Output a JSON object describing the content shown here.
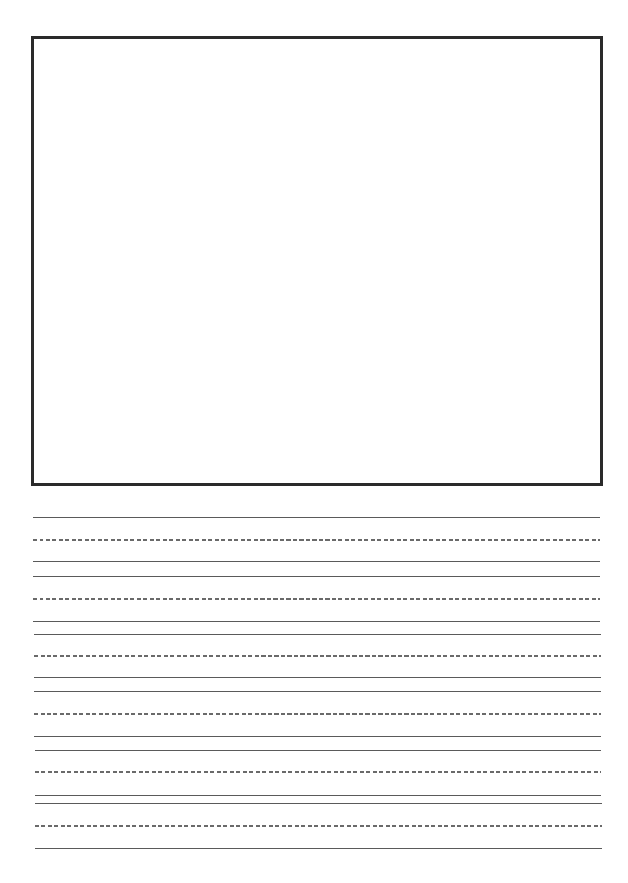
{
  "page": {
    "type": "handwriting-practice-sheet",
    "drawing_box": {
      "left": 31,
      "top": 36,
      "right": 602,
      "bottom": 486,
      "border_color": "#2a2a2a"
    },
    "line_color_solid": "#5a5a5a",
    "line_color_dashed": "#6a6a6a",
    "writing_rows": [
      {
        "top": 517,
        "mid": 539,
        "base": 561
      },
      {
        "top": 576,
        "mid": 598,
        "base": 621
      },
      {
        "top": 634,
        "mid": 655,
        "base": 677
      },
      {
        "top": 691,
        "mid": 713,
        "base": 736
      },
      {
        "top": 750,
        "mid": 771,
        "base": 795
      },
      {
        "top": 803,
        "mid": 825,
        "base": 848
      }
    ]
  }
}
